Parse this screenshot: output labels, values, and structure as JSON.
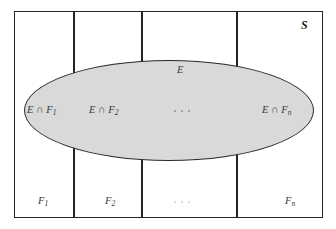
{
  "figure": {
    "type": "venn-partition-diagram",
    "sample_space_label": "S",
    "event_label": "E",
    "colors": {
      "ellipse_fill": "#d9d9d9",
      "ellipse_stroke": "#2a2a2a",
      "rect_stroke": "#242424",
      "background": "#ffffff",
      "label_text": "#3a3a3a"
    },
    "intersections": [
      {
        "id": "e-cap-f1",
        "text": "E ∩ F",
        "sub": "1"
      },
      {
        "id": "e-cap-f2",
        "text": "E ∩ F",
        "sub": "2"
      },
      {
        "id": "e-cap-fn",
        "text": "E ∩ F",
        "sub": "n"
      }
    ],
    "partitions": [
      {
        "id": "f1",
        "text": "F",
        "sub": "1"
      },
      {
        "id": "f2",
        "text": "F",
        "sub": "2"
      },
      {
        "id": "fn",
        "text": "F",
        "sub": "n"
      }
    ],
    "ellipsis_glyph": "···"
  }
}
